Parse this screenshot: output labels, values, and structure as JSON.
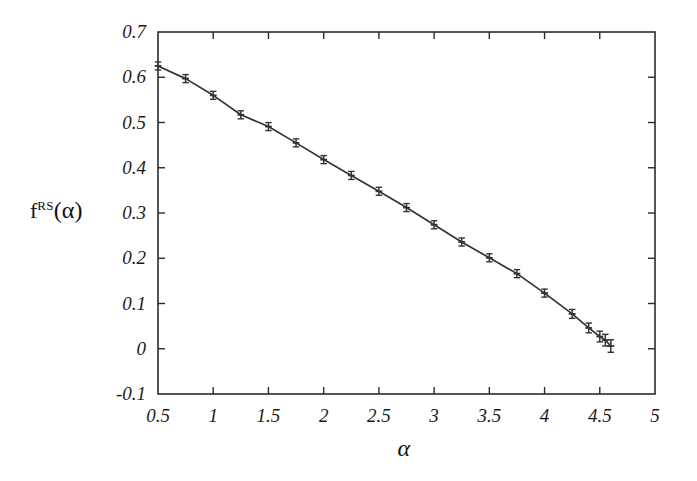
{
  "chart_data": {
    "type": "line",
    "title": "",
    "subtitle": "",
    "xlabel": "α",
    "ylabel": "f",
    "ylabel_sup": "RS",
    "ylabel_arg": "(α)",
    "ylabel_full": "f^RS(α)",
    "xlim": [
      0.5,
      5
    ],
    "ylim": [
      -0.1,
      0.7
    ],
    "xticks": [
      0.5,
      1,
      1.5,
      2,
      2.5,
      3,
      3.5,
      4,
      4.5,
      5
    ],
    "xtick_labels": [
      "0.5",
      "1",
      "1.5",
      "2",
      "2.5",
      "3",
      "3.5",
      "4",
      "4.5",
      "5"
    ],
    "yticks": [
      -0.1,
      0,
      0.1,
      0.2,
      0.3,
      0.4,
      0.5,
      0.6,
      0.7
    ],
    "ytick_labels": [
      "-0.1",
      "0",
      "0.1",
      "0.2",
      "0.3",
      "0.4",
      "0.5",
      "0.6",
      "0.7"
    ],
    "grid": false,
    "legend": null,
    "legend_position": "none",
    "tick_direction": "in",
    "frame": "box",
    "line_color": "#333333",
    "marker": "cross-with-errorbar",
    "marker_color": "#333333",
    "series": [
      {
        "name": "f^RS(alpha)",
        "x": [
          0.5,
          0.75,
          1.0,
          1.25,
          1.5,
          1.75,
          2.0,
          2.25,
          2.5,
          2.75,
          3.0,
          3.25,
          3.5,
          3.75,
          4.0,
          4.25,
          4.4,
          4.5,
          4.55,
          4.6
        ],
        "values": [
          0.625,
          0.597,
          0.56,
          0.517,
          0.491,
          0.455,
          0.418,
          0.383,
          0.348,
          0.312,
          0.274,
          0.236,
          0.201,
          0.166,
          0.123,
          0.077,
          0.046,
          0.027,
          0.019,
          0.006
        ],
        "yerr": [
          0.004,
          0.004,
          0.004,
          0.004,
          0.004,
          0.004,
          0.004,
          0.004,
          0.004,
          0.004,
          0.004,
          0.004,
          0.004,
          0.004,
          0.004,
          0.005,
          0.006,
          0.007,
          0.008,
          0.009
        ]
      }
    ]
  }
}
